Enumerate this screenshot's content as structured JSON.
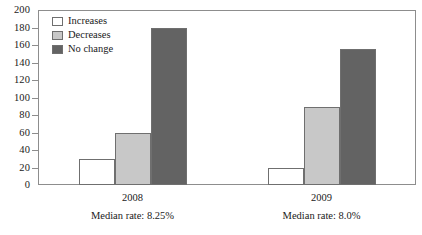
{
  "chart_data": {
    "type": "bar",
    "title": "",
    "xlabel": "",
    "ylabel": "",
    "ylim": [
      0,
      200
    ],
    "ytick_step": 20,
    "grid": false,
    "legend_position": "top-left",
    "categories": [
      "2008",
      "2009"
    ],
    "yticks": [
      "200",
      "180",
      "160",
      "140",
      "120",
      "100",
      "80",
      "60",
      "40",
      "20",
      "0"
    ],
    "series": [
      {
        "name": "Increases",
        "values": [
          30,
          20
        ],
        "color": "#ffffff"
      },
      {
        "name": "Decreases",
        "values": [
          60,
          89
        ],
        "color": "#c8c8c8"
      },
      {
        "name": "No change",
        "values": [
          180,
          155
        ],
        "color": "#636363"
      }
    ],
    "annotations": [
      {
        "group": "2008",
        "text": "Median rate: 8.25%"
      },
      {
        "group": "2009",
        "text": "Median rate: 8.0%"
      }
    ]
  },
  "axis": {
    "ticks": [
      {
        "label": "200",
        "value": 200
      },
      {
        "label": "180",
        "value": 180
      },
      {
        "label": "160",
        "value": 160
      },
      {
        "label": "140",
        "value": 140
      },
      {
        "label": "120",
        "value": 120
      },
      {
        "label": "100",
        "value": 100
      },
      {
        "label": "80",
        "value": 80
      },
      {
        "label": "60",
        "value": 60
      },
      {
        "label": "40",
        "value": 40
      },
      {
        "label": "20",
        "value": 20
      },
      {
        "label": "0",
        "value": 0
      }
    ]
  },
  "legend": {
    "items": [
      {
        "label": "Increases",
        "color": "#ffffff"
      },
      {
        "label": "Decreases",
        "color": "#c8c8c8"
      },
      {
        "label": "No change",
        "color": "#636363"
      }
    ]
  },
  "groups": [
    {
      "year": "2008",
      "median": "Median rate: 8.25%"
    },
    {
      "year": "2009",
      "median": "Median rate: 8.0%"
    }
  ]
}
